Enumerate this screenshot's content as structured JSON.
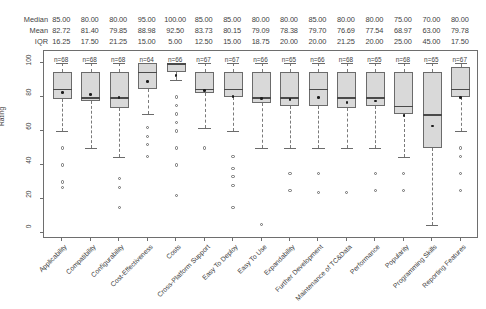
{
  "chart_data": {
    "type": "box",
    "title": "",
    "xlabel": "",
    "ylabel": "Rating",
    "ylim": [
      0,
      100
    ],
    "yticks": [
      0,
      20,
      40,
      60,
      80,
      100
    ],
    "grid": false,
    "legend": false,
    "stat_row_labels": [
      "Median",
      "Mean",
      "IQR"
    ],
    "categories": [
      "Applicability",
      "Compatibility",
      "Configurability",
      "Cost-Effectiveness",
      "Costs",
      "Cross-Platform Support",
      "Easy To Deploy",
      "Easy To Use",
      "Expandability",
      "Further Development",
      "Maintenance of TC&Data",
      "Performance",
      "Popularity",
      "Programming Skills",
      "Reporting Features"
    ],
    "median": [
      "85.00",
      "80.00",
      "80.00",
      "95.00",
      "100.00",
      "85.00",
      "85.00",
      "80.00",
      "80.00",
      "85.00",
      "80.00",
      "80.00",
      "75.00",
      "70.00",
      "80.00"
    ],
    "mean": [
      "82.72",
      "81.40",
      "79.85",
      "88.98",
      "92.50",
      "83.73",
      "80.15",
      "79.09",
      "78.38",
      "79.70",
      "76.69",
      "77.54",
      "68.97",
      "63.00",
      "79.78"
    ],
    "iqr": [
      "16.25",
      "17.50",
      "21.25",
      "15.00",
      "5.00",
      "12.50",
      "15.00",
      "18.75",
      "20.00",
      "20.00",
      "21.25",
      "20.00",
      "25.00",
      "45.00",
      "17.50"
    ],
    "counts": [
      "n=68",
      "n=68",
      "n=68",
      "n=64",
      "n=66",
      "n=67",
      "n=67",
      "n=66",
      "n=65",
      "n=66",
      "n=68",
      "n=65",
      "n=68",
      "n=65",
      "n=67"
    ],
    "boxes": [
      {
        "q1": 78.75,
        "q3": 95.0,
        "median": 85.0,
        "mean": 82.72,
        "whisker_low": 60.0,
        "whisker_high": 100.0,
        "outliers": [
          50,
          40,
          30,
          27
        ]
      },
      {
        "q1": 77.5,
        "q3": 95.0,
        "median": 80.0,
        "mean": 81.4,
        "whisker_low": 50.0,
        "whisker_high": 100.0,
        "outliers": []
      },
      {
        "q1": 73.75,
        "q3": 95.0,
        "median": 80.0,
        "mean": 79.85,
        "whisker_low": 45.0,
        "whisker_high": 100.0,
        "outliers": [
          32,
          27,
          15
        ]
      },
      {
        "q1": 85.0,
        "q3": 100.0,
        "median": 95.0,
        "mean": 88.98,
        "whisker_low": 70.0,
        "whisker_high": 100.0,
        "outliers": [
          62,
          57,
          52,
          45
        ]
      },
      {
        "q1": 95.0,
        "q3": 100.0,
        "median": 100.0,
        "mean": 92.5,
        "whisker_low": 90.0,
        "whisker_high": 100.0,
        "outliers": [
          80,
          75,
          70,
          65,
          60,
          50,
          40,
          22
        ]
      },
      {
        "q1": 82.5,
        "q3": 95.0,
        "median": 85.0,
        "mean": 83.73,
        "whisker_low": 62.0,
        "whisker_high": 100.0,
        "outliers": [
          50
        ]
      },
      {
        "q1": 80.0,
        "q3": 95.0,
        "median": 85.0,
        "mean": 80.15,
        "whisker_low": 60.0,
        "whisker_high": 100.0,
        "outliers": [
          45,
          38,
          33,
          28,
          15
        ]
      },
      {
        "q1": 76.25,
        "q3": 95.0,
        "median": 80.0,
        "mean": 79.09,
        "whisker_low": 50.0,
        "whisker_high": 100.0,
        "outliers": [
          5
        ]
      },
      {
        "q1": 75.0,
        "q3": 95.0,
        "median": 80.0,
        "mean": 78.38,
        "whisker_low": 50.0,
        "whisker_high": 100.0,
        "outliers": [
          35,
          25
        ]
      },
      {
        "q1": 75.0,
        "q3": 95.0,
        "median": 85.0,
        "mean": 79.7,
        "whisker_low": 50.0,
        "whisker_high": 100.0,
        "outliers": [
          35,
          24
        ]
      },
      {
        "q1": 73.75,
        "q3": 95.0,
        "median": 80.0,
        "mean": 76.69,
        "whisker_low": 50.0,
        "whisker_high": 100.0,
        "outliers": [
          24
        ]
      },
      {
        "q1": 75.0,
        "q3": 95.0,
        "median": 80.0,
        "mean": 77.54,
        "whisker_low": 50.0,
        "whisker_high": 100.0,
        "outliers": [
          35,
          25
        ]
      },
      {
        "q1": 70.0,
        "q3": 95.0,
        "median": 75.0,
        "mean": 68.97,
        "whisker_low": 45.0,
        "whisker_high": 100.0,
        "outliers": [
          35,
          25
        ]
      },
      {
        "q1": 50.0,
        "q3": 95.0,
        "median": 70.0,
        "mean": 63.0,
        "whisker_low": 5.0,
        "whisker_high": 100.0,
        "outliers": []
      },
      {
        "q1": 80.0,
        "q3": 97.5,
        "median": 85.0,
        "mean": 79.78,
        "whisker_low": 60.0,
        "whisker_high": 100.0,
        "outliers": [
          50,
          45,
          35,
          25
        ]
      }
    ]
  }
}
